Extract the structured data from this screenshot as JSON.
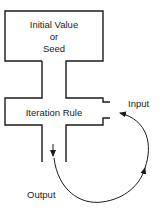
{
  "diagram": {
    "seed_box": {
      "line1": "Initial Value",
      "line2": "or",
      "line3": "Seed"
    },
    "rule_box": {
      "label": "Iteration Rule"
    },
    "labels": {
      "input": "Input",
      "output": "Output"
    },
    "colors": {
      "stroke": "#1a1a1a",
      "background": "#ffffff"
    }
  }
}
